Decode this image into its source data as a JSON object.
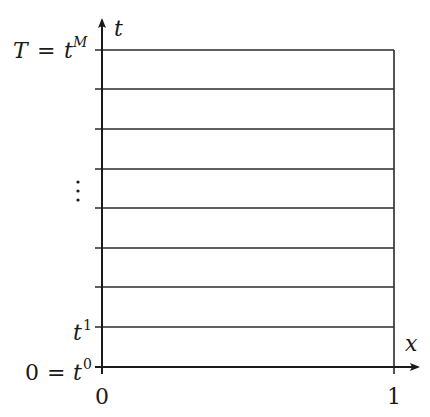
{
  "diagram": {
    "type": "time-space grid",
    "axes": {
      "vertical": {
        "label": "t",
        "color": "#1a1a1a"
      },
      "horizontal": {
        "label": "x",
        "color": "#1a1a1a"
      }
    },
    "x_ticks": [
      {
        "label": "0"
      },
      {
        "label": "1"
      }
    ],
    "t_labels": {
      "top": {
        "lhs": "T",
        "eq": "=",
        "var": "t",
        "sup": "M"
      },
      "ellipsis": "⋮",
      "t1": {
        "var": "t",
        "sup": "1"
      },
      "bottom": {
        "lhs": "0",
        "eq": "=",
        "var": "t",
        "sup": "0"
      }
    },
    "grid": {
      "horizontal_line_count": 9,
      "line_color": "#2a2a2a"
    }
  }
}
